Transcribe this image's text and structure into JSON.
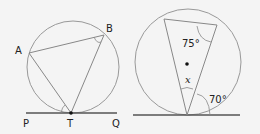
{
  "figures": [
    {
      "id": "figure-left",
      "points": {
        "A": {
          "label": "A"
        },
        "B": {
          "label": "B"
        },
        "T": {
          "label": "T"
        },
        "P": {
          "label": "P"
        },
        "Q": {
          "label": "Q"
        }
      }
    },
    {
      "id": "figure-right",
      "angles": {
        "inscribed_top": "75°",
        "unknown": "x",
        "tangent_chord": "70°"
      }
    }
  ],
  "colors": {
    "stroke": "#8a8a8a",
    "line": "#555555",
    "text": "#222222",
    "background": "#f4f4f4"
  }
}
